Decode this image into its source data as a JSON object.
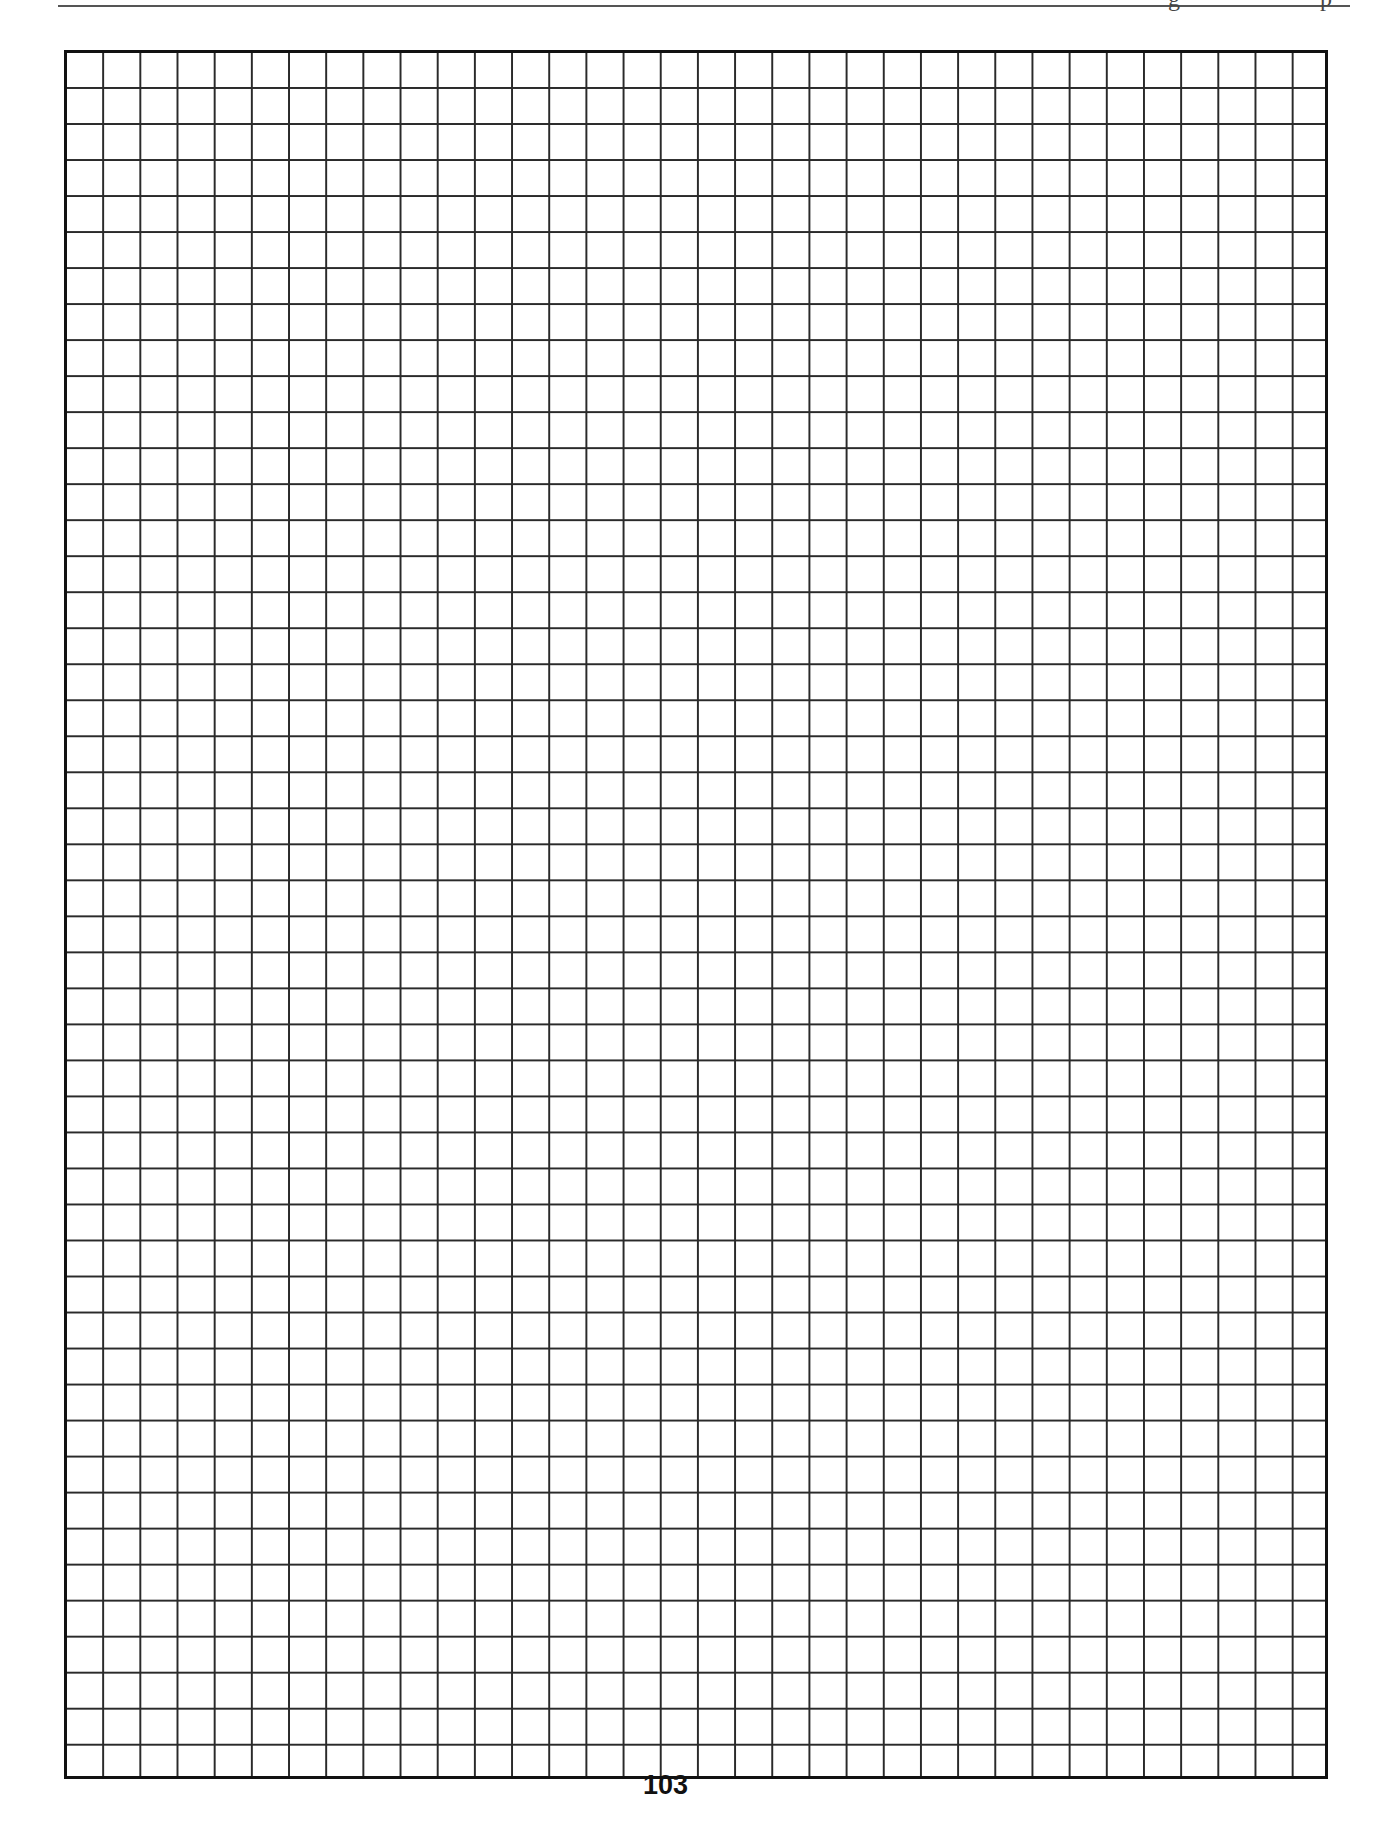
{
  "page": {
    "type": "graph-paper-worksheet",
    "page_number": "103",
    "grid": {
      "columns": 34,
      "rows": 48,
      "line_color": "#2a2a2a",
      "border_color": "#111111"
    },
    "header": {
      "rule_color": "#555555"
    }
  }
}
